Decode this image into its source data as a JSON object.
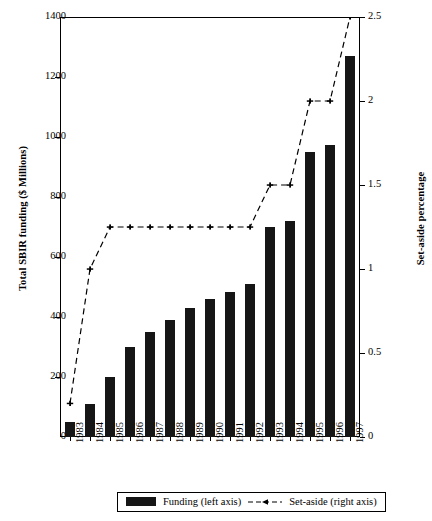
{
  "chart_data": {
    "type": "bar",
    "title": "",
    "categories": [
      "1983",
      "1984",
      "1985",
      "1986",
      "1987",
      "1988",
      "1989",
      "1990",
      "1991",
      "1992",
      "1993",
      "1994",
      "1995",
      "1996",
      "1997"
    ],
    "series": [
      {
        "name": "Funding (left axis)",
        "axis": "left",
        "type": "bar",
        "values": [
          50,
          110,
          200,
          300,
          350,
          390,
          430,
          460,
          485,
          510,
          700,
          720,
          950,
          975,
          1270
        ]
      },
      {
        "name": "Set-aside (right axis)",
        "axis": "right",
        "type": "line",
        "values": [
          0.2,
          1.0,
          1.25,
          1.25,
          1.25,
          1.25,
          1.25,
          1.25,
          1.25,
          1.25,
          1.5,
          1.5,
          2.0,
          2.0,
          2.5
        ]
      }
    ],
    "xlabel": "",
    "ylabel": "Total SBIR funding ($ Millions)",
    "ylabel_right": "Set-aside percentage",
    "ylim": [
      0,
      1400
    ],
    "ylim_right": [
      0,
      2.5
    ],
    "yticks": [
      0,
      200,
      400,
      600,
      800,
      1000,
      1200,
      1400
    ],
    "yticks_right": [
      0,
      0.5,
      1,
      1.5,
      2,
      2.5
    ],
    "grid": false,
    "legend_position": "bottom"
  },
  "axes": {
    "left_title": "Total SBIR funding ($ Millions)",
    "right_title": "Set-aside percentage",
    "left_ticks": [
      "0",
      "200",
      "400",
      "600",
      "800",
      "1000",
      "1200",
      "1400"
    ],
    "right_ticks": [
      "0",
      "0.5",
      "1",
      "1.5",
      "2",
      "2.5"
    ],
    "x_ticks": [
      "1983",
      "1984",
      "1985",
      "1986",
      "1987",
      "1988",
      "1989",
      "1990",
      "1991",
      "1992",
      "1993",
      "1994",
      "1995",
      "1996",
      "1997"
    ]
  },
  "legend": {
    "bar_label": "Funding (left axis)",
    "line_label": "Set-aside (right axis)"
  },
  "colors": {
    "bar": "#161616",
    "line": "#000000",
    "axis": "#000000",
    "background": "#ffffff"
  }
}
